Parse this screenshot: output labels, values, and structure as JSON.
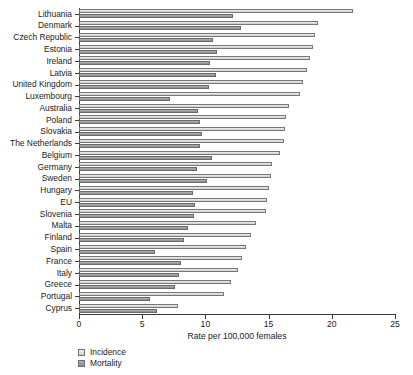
{
  "chart_data": {
    "type": "bar",
    "orientation": "horizontal",
    "title": "",
    "xlabel": "Rate per 100,000 females",
    "ylabel": "",
    "xlim": [
      0,
      25
    ],
    "xticks": [
      0,
      5,
      10,
      15,
      20,
      25
    ],
    "xtick_labels": [
      "0",
      "5",
      "10",
      "15",
      "20",
      "25"
    ],
    "grid": false,
    "legend_position": "bottom-left",
    "categories": [
      "Lithuania",
      "Denmark",
      "Czech Republic",
      "Estonia",
      "Ireland",
      "Latvia",
      "United Kingdom",
      "Luxembourg",
      "Australia",
      "Poland",
      "Slovakia",
      "The Netherlands",
      "Belgium",
      "Germany",
      "Sweden",
      "Hungary",
      "EU",
      "Slovenia",
      "Malta",
      "Finland",
      "Spain",
      "France",
      "Italy",
      "Greece",
      "Portugal",
      "Cyprus"
    ],
    "series": [
      {
        "name": "Incidence",
        "color": "#dcdcdc",
        "values": [
          21.7,
          18.9,
          18.7,
          18.5,
          18.3,
          18.0,
          17.7,
          17.5,
          16.6,
          16.4,
          16.3,
          16.2,
          15.9,
          15.3,
          15.2,
          15.0,
          14.9,
          14.8,
          14.0,
          13.6,
          13.2,
          12.9,
          12.6,
          12.0,
          11.5,
          7.8
        ]
      },
      {
        "name": "Mortality",
        "color": "#9d9d9d",
        "values": [
          12.2,
          12.8,
          10.6,
          10.9,
          10.4,
          10.8,
          10.3,
          7.2,
          9.4,
          9.6,
          9.7,
          9.6,
          10.5,
          9.3,
          10.1,
          9.0,
          9.2,
          9.1,
          8.6,
          8.3,
          6.0,
          8.1,
          7.9,
          7.6,
          5.6,
          6.2
        ]
      }
    ]
  },
  "legend": {
    "items": [
      {
        "label": "Incidence",
        "swatch": "incidence"
      },
      {
        "label": "Mortality",
        "swatch": "mortality"
      }
    ]
  }
}
